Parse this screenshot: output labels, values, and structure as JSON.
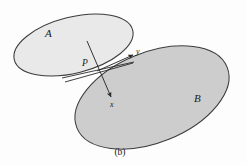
{
  "figure": {
    "caption": "(b)",
    "background_color": "#fdfdfd",
    "width": 247,
    "height": 165
  },
  "regions": [
    {
      "id": "region-a",
      "label": "A",
      "fill_color": "#e9e9e9",
      "stroke_color": "#3b3b3b",
      "cx": 73.5,
      "cy": 45.0,
      "rx": 61.0,
      "ry": 28.0,
      "rotation": -14,
      "label_x": 45,
      "label_y": 37
    },
    {
      "id": "region-b",
      "label": "B",
      "fill_color": "#cdcdcd",
      "stroke_color": "#3b3b3b",
      "cx": 152.0,
      "cy": 97.5,
      "rx": 81.0,
      "ry": 45.0,
      "rotation": -22,
      "label_x": 194,
      "label_y": 102
    }
  ],
  "tangency": {
    "point_label": "P",
    "point_x": 97,
    "point_y": 71,
    "label_x": 82,
    "label_y": 66
  },
  "axes": [
    {
      "id": "axis-x",
      "label": "x",
      "from_x": 87,
      "from_y": 41,
      "to_x": 111,
      "to_y": 97,
      "label_x": 110,
      "label_y": 107,
      "stroke_color": "#2a2a2a",
      "has_arrow": true
    },
    {
      "id": "axis-y",
      "label": "y",
      "from_x": 97,
      "from_y": 71,
      "to_x": 133,
      "to_y": 55,
      "label_x": 136,
      "label_y": 54,
      "stroke_color": "#2a2a2a",
      "has_arrow": true
    }
  ],
  "tangent_lines": [
    {
      "id": "tangent-upper",
      "from_x": 62,
      "from_y": 78,
      "to_x": 134,
      "to_y": 62,
      "stroke_color": "#2a2a2a"
    },
    {
      "id": "tangent-lower",
      "from_x": 65,
      "from_y": 82,
      "to_x": 133,
      "to_y": 63,
      "stroke_color": "#2a2a2a"
    }
  ],
  "caption": {
    "text": "(b)",
    "x": 120,
    "y": 155
  }
}
